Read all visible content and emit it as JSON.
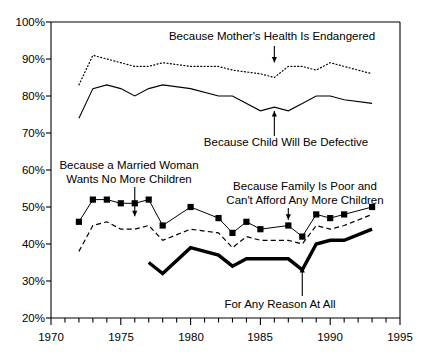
{
  "chart_data": {
    "type": "line",
    "title": "",
    "xlabel": "",
    "ylabel": "",
    "xlim": [
      1970,
      1995
    ],
    "ylim": [
      20,
      100
    ],
    "grid": false,
    "legend_position": "inline-annotations",
    "ytick_labels": [
      "20%",
      "30%",
      "40%",
      "50%",
      "60%",
      "70%",
      "80%",
      "90%",
      "100%"
    ],
    "ytick_values": [
      20,
      30,
      40,
      50,
      60,
      70,
      80,
      90,
      100
    ],
    "xtick_labels": [
      "1970",
      "1975",
      "1980",
      "1985",
      "1990",
      "1995"
    ],
    "xtick_values": [
      1970,
      1975,
      1980,
      1985,
      1990,
      1995
    ],
    "xminor_step": 1,
    "series": [
      {
        "name": "Because Mother's Health Is Endangered",
        "style": "dotted",
        "marker": "none",
        "x": [
          1972,
          1973,
          1974,
          1975,
          1976,
          1977,
          1978,
          1980,
          1982,
          1983,
          1985,
          1986,
          1987,
          1988,
          1989,
          1990,
          1991,
          1993
        ],
        "values": [
          83,
          91,
          90,
          89,
          88,
          88,
          89,
          88,
          88,
          87,
          86,
          85,
          88,
          88,
          87,
          89,
          88,
          86
        ]
      },
      {
        "name": "Because Child Will Be Defective",
        "style": "solid-thin",
        "marker": "none",
        "x": [
          1972,
          1973,
          1974,
          1975,
          1976,
          1977,
          1978,
          1980,
          1982,
          1983,
          1985,
          1986,
          1987,
          1988,
          1989,
          1990,
          1991,
          1993
        ],
        "values": [
          74,
          82,
          83,
          82,
          80,
          82,
          83,
          82,
          80,
          80,
          76,
          77,
          76,
          78,
          80,
          80,
          79,
          78
        ]
      },
      {
        "name": "Because a Married Woman Wants No More Children",
        "style": "solid-marker",
        "marker": "square",
        "x": [
          1972,
          1973,
          1974,
          1975,
          1976,
          1977,
          1978,
          1980,
          1982,
          1983,
          1984,
          1985,
          1987,
          1988,
          1989,
          1990,
          1991,
          1993
        ],
        "values": [
          46,
          52,
          52,
          51,
          51,
          52,
          45,
          50,
          47,
          43,
          46,
          44,
          45,
          42,
          48,
          47,
          48,
          50
        ]
      },
      {
        "name": "Because Family Is Poor and Can't Afford Any More Children",
        "style": "dashed",
        "marker": "none",
        "x": [
          1972,
          1973,
          1974,
          1975,
          1976,
          1977,
          1978,
          1980,
          1982,
          1983,
          1984,
          1985,
          1987,
          1988,
          1989,
          1990,
          1991,
          1993
        ],
        "values": [
          38,
          45,
          46,
          44,
          44,
          45,
          41,
          44,
          43,
          39,
          42,
          41,
          41,
          40,
          45,
          44,
          45,
          48
        ]
      },
      {
        "name": "For Any Reason At All",
        "style": "solid-thick",
        "marker": "none",
        "x": [
          1977,
          1978,
          1980,
          1982,
          1983,
          1984,
          1985,
          1987,
          1988,
          1989,
          1990,
          1991,
          1993
        ],
        "values": [
          35,
          32,
          39,
          37,
          34,
          36,
          36,
          36,
          33,
          40,
          41,
          41,
          44
        ]
      }
    ],
    "annotations": [
      {
        "label": "Because Mother's Health Is Endangered",
        "target_x": 1986,
        "target_y": 87
      },
      {
        "label": "Because Child Will Be Defective",
        "target_x": 1986,
        "target_y": 76
      },
      {
        "label": "Because a Married Woman Wants No More Children",
        "target_x": 1976,
        "target_y": 47
      },
      {
        "label": "Because Family Is Poor and Can't Afford Any More Children",
        "target_x": 1987,
        "target_y": 45
      },
      {
        "label": "For Any Reason At All",
        "target_x": 1988,
        "target_y": 33
      }
    ]
  },
  "colors": {
    "ink": "#000000",
    "background": "#ffffff"
  },
  "labels": {
    "annot_mother_health": "Because Mother's Health Is Endangered",
    "annot_child_defective": "Because Child Will Be Defective",
    "annot_married_woman_l1": "Because a Married Woman",
    "annot_married_woman_l2": "Wants No More Children",
    "annot_family_poor_l1": "Because Family Is Poor and",
    "annot_family_poor_l2": "Can't Afford Any More Children",
    "annot_any_reason": "For Any Reason At All"
  },
  "axis": {
    "y": {
      "t100": "100%",
      "t90": "90%",
      "t80": "80%",
      "t70": "70%",
      "t60": "60%",
      "t50": "50%",
      "t40": "40%",
      "t30": "30%",
      "t20": "20%"
    },
    "x": {
      "t1970": "1970",
      "t1975": "1975",
      "t1980": "1980",
      "t1985": "1985",
      "t1990": "1990",
      "t1995": "1995"
    }
  }
}
